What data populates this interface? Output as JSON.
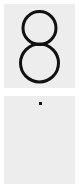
{
  "top_panel": {
    "glyph": "8",
    "glyph_name": "digit-eight"
  },
  "bottom_panel": {
    "glyph": "·",
    "glyph_name": "dot"
  },
  "colors": {
    "background": "#ffffff",
    "panel": "#ededed",
    "ink": "#111111"
  }
}
